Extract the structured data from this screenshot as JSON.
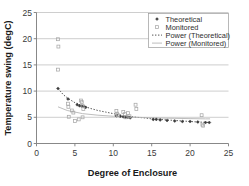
{
  "chart_data": {
    "type": "scatter",
    "title": "",
    "xlabel": "Degree of Enclosure",
    "ylabel": "Temperature swing (degC)",
    "xlim": [
      0,
      25
    ],
    "ylim": [
      0,
      25
    ],
    "xticks": [
      0,
      5,
      10,
      15,
      20,
      25
    ],
    "yticks": [
      0,
      5,
      10,
      15,
      20,
      25
    ],
    "grid": "horizontal",
    "legend_position": "top-right",
    "legend": [
      "Theoretical",
      "Monitored",
      "Power (Theoretical)",
      "Power (Monitored)"
    ],
    "series": [
      {
        "name": "Theoretical",
        "type": "scatter",
        "marker": "diamond",
        "color": "#3b3b3b",
        "points": [
          [
            2.8,
            10.5
          ],
          [
            4.1,
            8.5
          ],
          [
            5.3,
            7.4
          ],
          [
            5.6,
            7.2
          ],
          [
            5.9,
            7.1
          ],
          [
            6.2,
            7.0
          ],
          [
            6.4,
            6.9
          ],
          [
            10.4,
            5.3
          ],
          [
            10.9,
            5.2
          ],
          [
            11.3,
            5.1
          ],
          [
            11.6,
            5.0
          ],
          [
            11.9,
            5.0
          ],
          [
            12.2,
            4.9
          ],
          [
            15.2,
            4.6
          ],
          [
            15.6,
            4.6
          ],
          [
            16.1,
            4.5
          ],
          [
            17.0,
            4.4
          ],
          [
            18.0,
            4.3
          ],
          [
            19.0,
            4.2
          ],
          [
            20.0,
            4.2
          ],
          [
            21.0,
            4.1
          ],
          [
            22.0,
            4.0
          ],
          [
            22.5,
            4.0
          ]
        ]
      },
      {
        "name": "Monitored",
        "type": "scatter",
        "marker": "square-open",
        "color": "#a8a8a8",
        "points": [
          [
            2.8,
            19.9
          ],
          [
            2.85,
            18.5
          ],
          [
            2.8,
            14.1
          ],
          [
            4.1,
            7.6
          ],
          [
            4.15,
            7.0
          ],
          [
            4.2,
            5.1
          ],
          [
            4.6,
            6.3
          ],
          [
            4.8,
            5.9
          ],
          [
            5.0,
            4.3
          ],
          [
            5.5,
            4.6
          ],
          [
            5.8,
            8.2
          ],
          [
            5.9,
            7.9
          ],
          [
            6.0,
            7.2
          ],
          [
            6.1,
            6.6
          ],
          [
            6.0,
            5.0
          ],
          [
            10.4,
            6.2
          ],
          [
            10.5,
            5.7
          ],
          [
            10.6,
            5.4
          ],
          [
            11.3,
            6.0
          ],
          [
            11.5,
            5.6
          ],
          [
            11.6,
            5.0
          ],
          [
            11.9,
            5.8
          ],
          [
            12.1,
            5.2
          ],
          [
            12.9,
            7.4
          ],
          [
            13.0,
            6.6
          ],
          [
            21.5,
            5.4
          ],
          [
            21.6,
            3.6
          ],
          [
            21.7,
            3.4
          ]
        ]
      }
    ],
    "trendlines": [
      {
        "name": "Power (Theoretical)",
        "style": "dotted",
        "color": "#555555",
        "points": [
          [
            2.8,
            10.5
          ],
          [
            3.5,
            9.3
          ],
          [
            4.2,
            8.5
          ],
          [
            5.0,
            7.8
          ],
          [
            6.0,
            7.2
          ],
          [
            7.0,
            6.7
          ],
          [
            8.0,
            6.3
          ],
          [
            9.0,
            6.0
          ],
          [
            10.0,
            5.7
          ],
          [
            11.0,
            5.4
          ],
          [
            12.0,
            5.2
          ],
          [
            13.0,
            5.0
          ],
          [
            14.0,
            4.9
          ],
          [
            15.0,
            4.7
          ],
          [
            16.0,
            4.6
          ],
          [
            17.0,
            4.5
          ],
          [
            18.0,
            4.4
          ],
          [
            19.0,
            4.3
          ],
          [
            20.0,
            4.2
          ],
          [
            21.0,
            4.1
          ],
          [
            22.0,
            4.05
          ],
          [
            22.6,
            4.0
          ]
        ]
      },
      {
        "name": "Power (Monitored)",
        "style": "solid",
        "color": "#b5b5b5",
        "points": [
          [
            2.8,
            7.0
          ],
          [
            4.0,
            6.3
          ],
          [
            6.0,
            5.7
          ],
          [
            8.0,
            5.4
          ],
          [
            10.0,
            5.2
          ],
          [
            12.0,
            5.05
          ],
          [
            14.0,
            4.95
          ],
          [
            16.0,
            4.85
          ],
          [
            18.0,
            4.8
          ],
          [
            20.0,
            4.75
          ],
          [
            22.0,
            4.7
          ],
          [
            22.6,
            4.7
          ]
        ]
      }
    ]
  }
}
